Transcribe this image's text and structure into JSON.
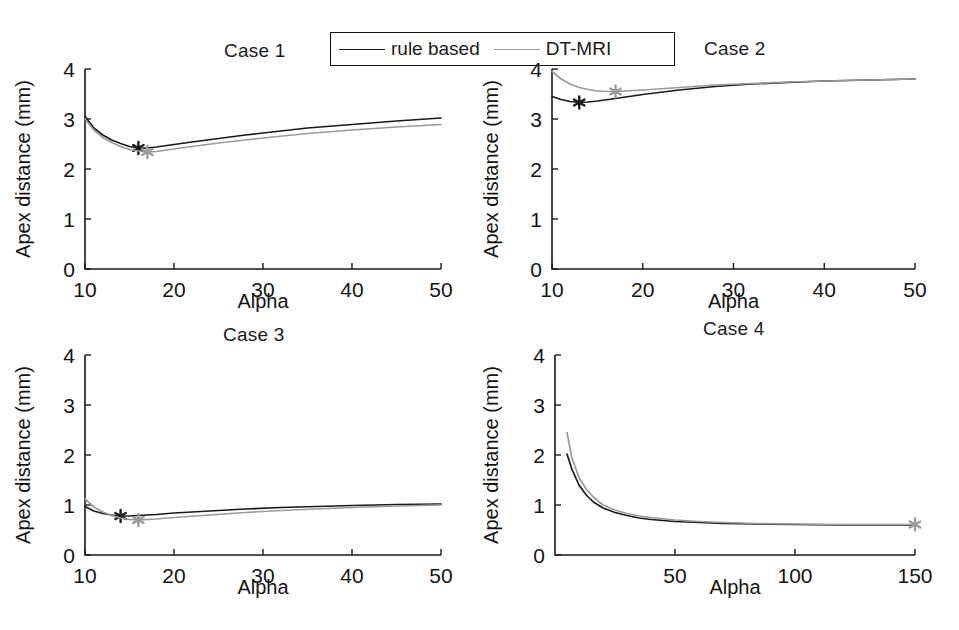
{
  "figure": {
    "width": 959,
    "height": 630,
    "background": "#ffffff"
  },
  "legend": {
    "entries": [
      {
        "label": "rule based",
        "color": "#1a1a1a",
        "style": "solid"
      },
      {
        "label": "DT-MRI",
        "color": "#9a9a9a",
        "style": "solid"
      }
    ]
  },
  "colors": {
    "rule_based": "#1a1a1a",
    "dt_mri": "#9a9a9a",
    "axis": "#1a1a1a"
  },
  "chart_data": [
    {
      "type": "line",
      "title": "Case 1",
      "xlabel": "Alpha",
      "ylabel": "Apex distance (mm)",
      "xlim": [
        10,
        50
      ],
      "ylim": [
        0,
        4
      ],
      "xticks": [
        10,
        20,
        30,
        40,
        50
      ],
      "yticks": [
        0,
        1,
        2,
        3,
        4
      ],
      "grid": false,
      "legend_position": "figure-top",
      "series": [
        {
          "name": "rule based",
          "color": "#1a1a1a",
          "x": [
            10,
            11,
            12,
            13,
            14,
            15,
            16,
            17,
            18,
            20,
            22,
            25,
            28,
            30,
            35,
            40,
            45,
            50
          ],
          "values": [
            3.05,
            2.82,
            2.68,
            2.58,
            2.51,
            2.45,
            2.42,
            2.42,
            2.44,
            2.49,
            2.54,
            2.61,
            2.68,
            2.72,
            2.82,
            2.89,
            2.96,
            3.02
          ],
          "marker": {
            "x": 16,
            "y": 2.42,
            "symbol": "star",
            "color": "#1a1a1a"
          }
        },
        {
          "name": "DT-MRI",
          "color": "#9a9a9a",
          "x": [
            10,
            11,
            12,
            13,
            14,
            15,
            16,
            17,
            18,
            20,
            22,
            25,
            28,
            30,
            35,
            40,
            45,
            50
          ],
          "values": [
            3.0,
            2.78,
            2.63,
            2.53,
            2.45,
            2.39,
            2.36,
            2.34,
            2.35,
            2.4,
            2.45,
            2.52,
            2.58,
            2.62,
            2.71,
            2.78,
            2.84,
            2.89
          ],
          "marker": {
            "x": 17,
            "y": 2.34,
            "symbol": "star",
            "color": "#9a9a9a"
          }
        }
      ]
    },
    {
      "type": "line",
      "title": "Case 2",
      "xlabel": "Alpha",
      "ylabel": "Apex distance (mm)",
      "xlim": [
        10,
        50
      ],
      "ylim": [
        0,
        4
      ],
      "xticks": [
        10,
        20,
        30,
        40,
        50
      ],
      "yticks": [
        0,
        1,
        2,
        3,
        4
      ],
      "grid": false,
      "legend_position": "figure-top",
      "series": [
        {
          "name": "rule based",
          "color": "#1a1a1a",
          "x": [
            10,
            11,
            12,
            13,
            14,
            15,
            17,
            20,
            24,
            28,
            32,
            36,
            40,
            45,
            50
          ],
          "values": [
            3.45,
            3.39,
            3.35,
            3.33,
            3.34,
            3.36,
            3.41,
            3.49,
            3.58,
            3.65,
            3.7,
            3.73,
            3.76,
            3.78,
            3.8
          ],
          "marker": {
            "x": 13,
            "y": 3.33,
            "symbol": "star",
            "color": "#1a1a1a"
          }
        },
        {
          "name": "DT-MRI",
          "color": "#9a9a9a",
          "x": [
            10,
            11,
            12,
            13,
            14,
            15,
            16,
            17,
            18,
            20,
            24,
            28,
            32,
            36,
            40,
            45,
            50
          ],
          "values": [
            3.95,
            3.8,
            3.7,
            3.63,
            3.59,
            3.56,
            3.55,
            3.55,
            3.56,
            3.58,
            3.63,
            3.68,
            3.71,
            3.74,
            3.76,
            3.78,
            3.8
          ],
          "marker": {
            "x": 17,
            "y": 3.55,
            "symbol": "star",
            "color": "#9a9a9a"
          }
        }
      ]
    },
    {
      "type": "line",
      "title": "Case 3",
      "xlabel": "Alpha",
      "ylabel": "Apex distance (mm)",
      "xlim": [
        10,
        50
      ],
      "ylim": [
        0,
        4
      ],
      "xticks": [
        10,
        20,
        30,
        40,
        50
      ],
      "yticks": [
        0,
        1,
        2,
        3,
        4
      ],
      "grid": false,
      "legend_position": "figure-top",
      "series": [
        {
          "name": "rule based",
          "color": "#1a1a1a",
          "x": [
            10,
            11,
            12,
            13,
            14,
            15,
            16,
            18,
            20,
            24,
            28,
            32,
            36,
            40,
            45,
            50
          ],
          "values": [
            0.97,
            0.88,
            0.83,
            0.8,
            0.78,
            0.78,
            0.79,
            0.81,
            0.84,
            0.88,
            0.92,
            0.95,
            0.97,
            0.99,
            1.01,
            1.02
          ],
          "marker": {
            "x": 14,
            "y": 0.78,
            "symbol": "star",
            "color": "#1a1a1a"
          }
        },
        {
          "name": "DT-MRI",
          "color": "#9a9a9a",
          "x": [
            10,
            11,
            12,
            13,
            14,
            15,
            16,
            18,
            20,
            24,
            28,
            32,
            36,
            40,
            45,
            50
          ],
          "values": [
            1.12,
            0.96,
            0.86,
            0.79,
            0.74,
            0.71,
            0.7,
            0.72,
            0.75,
            0.8,
            0.85,
            0.89,
            0.92,
            0.95,
            0.98,
            1.0
          ],
          "marker": {
            "x": 16,
            "y": 0.7,
            "symbol": "star",
            "color": "#9a9a9a"
          }
        }
      ]
    },
    {
      "type": "line",
      "title": "Case 4",
      "xlabel": "Alpha",
      "ylabel": "Apex distance (mm)",
      "xlim": [
        0,
        150
      ],
      "ylim": [
        0,
        4
      ],
      "xticks": [
        50,
        100,
        150
      ],
      "yticks": [
        0,
        1,
        2,
        3,
        4
      ],
      "grid": false,
      "legend_position": "figure-top",
      "series": [
        {
          "name": "rule based",
          "color": "#1a1a1a",
          "x": [
            5,
            7,
            10,
            13,
            16,
            20,
            25,
            30,
            35,
            40,
            50,
            60,
            70,
            85,
            100,
            120,
            150
          ],
          "values": [
            2.02,
            1.72,
            1.4,
            1.2,
            1.06,
            0.94,
            0.85,
            0.79,
            0.74,
            0.71,
            0.67,
            0.65,
            0.63,
            0.62,
            0.61,
            0.6,
            0.6
          ]
        },
        {
          "name": "DT-MRI",
          "color": "#9a9a9a",
          "x": [
            5,
            7,
            10,
            13,
            16,
            20,
            25,
            30,
            35,
            40,
            50,
            60,
            70,
            85,
            100,
            120,
            150
          ],
          "values": [
            2.45,
            1.95,
            1.55,
            1.32,
            1.16,
            1.0,
            0.9,
            0.83,
            0.78,
            0.75,
            0.7,
            0.67,
            0.65,
            0.63,
            0.62,
            0.61,
            0.61
          ],
          "marker": {
            "x": 150,
            "y": 0.61,
            "symbol": "star",
            "color": "#9a9a9a"
          }
        }
      ]
    }
  ]
}
